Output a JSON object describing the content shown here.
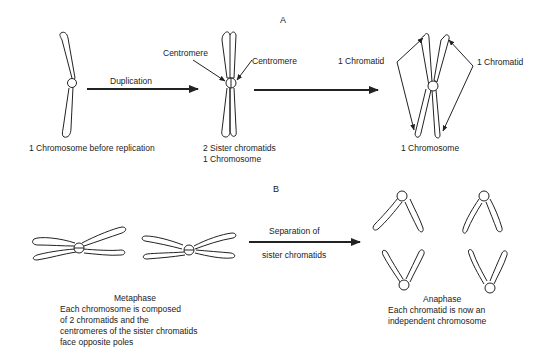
{
  "section_a": {
    "label": "A",
    "stage1_caption": "1 Chromosome before replication",
    "arrow1_label": "Duplication",
    "centromere_left": "Centromere",
    "centromere_right": "Centromere",
    "stage2_caption_line1": "2  Sister chromatids",
    "stage2_caption_line2": "1  Chromosome",
    "chromatid_left": "1  Chromatid",
    "chromatid_right": "1  Chromatid",
    "stage3_caption": "1  Chromosome"
  },
  "section_b": {
    "label": "B",
    "arrow_label_line1": "Separation of",
    "arrow_label_line2": "sister chromatids",
    "metaphase_title": "Metaphase",
    "metaphase_desc_line1": "Each chromosome is composed",
    "metaphase_desc_line2": "of 2 chromatids and the",
    "metaphase_desc_line3": "centromeres of the sister chromatids",
    "metaphase_desc_line4": "face opposite poles",
    "anaphase_title": "Anaphase",
    "anaphase_desc_line1": "Each chromatid is now an",
    "anaphase_desc_line2": "independent chromosome"
  },
  "colors": {
    "stroke": "#222222",
    "background": "#ffffff"
  }
}
